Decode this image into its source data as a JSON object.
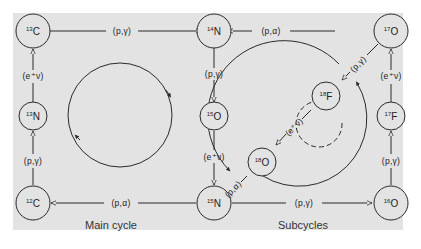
{
  "diagram": {
    "colors": {
      "panel_bg": "#e3e3e3",
      "line": "#2a2a2a",
      "page_bg": "#ffffff"
    },
    "captions": {
      "main": "Main cycle",
      "sub": "Subcycles"
    },
    "nodes": [
      {
        "id": "C13",
        "mass": "13",
        "element": "C"
      },
      {
        "id": "N14",
        "mass": "14",
        "element": "N"
      },
      {
        "id": "O17",
        "mass": "17",
        "element": "O"
      },
      {
        "id": "N13",
        "mass": "13",
        "element": "N"
      },
      {
        "id": "O15",
        "mass": "15",
        "element": "O"
      },
      {
        "id": "F18",
        "mass": "18",
        "element": "F"
      },
      {
        "id": "F17",
        "mass": "17",
        "element": "F"
      },
      {
        "id": "O18",
        "mass": "18",
        "element": "O"
      },
      {
        "id": "C12",
        "mass": "12",
        "element": "C"
      },
      {
        "id": "N15",
        "mass": "15",
        "element": "N"
      },
      {
        "id": "O16",
        "mass": "16",
        "element": "O"
      }
    ],
    "reactions": [
      {
        "from": "C13",
        "to": "N14",
        "label": "(p,γ)"
      },
      {
        "from": "O17",
        "to": "N14",
        "label": "(p,α)"
      },
      {
        "from": "N13",
        "to": "C13",
        "label": "(e⁺ν)"
      },
      {
        "from": "N14",
        "to": "O15",
        "label": "(p,γ)"
      },
      {
        "from": "O17",
        "to": "F18",
        "label": "(p,γ)"
      },
      {
        "from": "F17",
        "to": "O17",
        "label": "(e⁺ν)"
      },
      {
        "from": "F18",
        "to": "O18",
        "label": "(e⁺ν)"
      },
      {
        "from": "C12",
        "to": "N13",
        "label": "(p,γ)"
      },
      {
        "from": "O15",
        "to": "N15",
        "label": "(e⁺ν)"
      },
      {
        "from": "O18",
        "to": "N15",
        "label": "(p,α)"
      },
      {
        "from": "O16",
        "to": "F17",
        "label": "(p,γ)"
      },
      {
        "from": "N15",
        "to": "C12",
        "label": "(p,α)"
      },
      {
        "from": "N15",
        "to": "O16",
        "label": "(p,γ)"
      }
    ]
  }
}
